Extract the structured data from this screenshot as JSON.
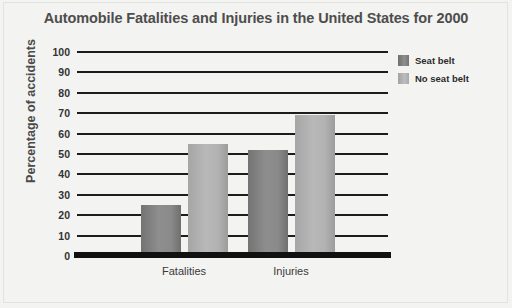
{
  "chart_data": {
    "type": "bar",
    "title": "Automobile Fatalities and Injuries in the United States for 2000",
    "xlabel": "",
    "ylabel": "Percentage of accidents",
    "categories": [
      "Fatalities",
      "Injuries"
    ],
    "series": [
      {
        "name": "Seat belt",
        "values": [
          25,
          52
        ],
        "color": "#8a8a8a"
      },
      {
        "name": "No seat belt",
        "values": [
          55,
          69
        ],
        "color": "#b2b2b2"
      }
    ],
    "ylim": [
      0,
      100
    ],
    "yticks": [
      0,
      10,
      20,
      30,
      40,
      50,
      60,
      70,
      80,
      90,
      100
    ],
    "ytick_labels": [
      "0",
      "10",
      "20",
      "30",
      "40",
      "50",
      "60",
      "70",
      "80",
      "90",
      "100"
    ],
    "grid": true,
    "legend_position": "top-right",
    "background_color": "#f3f3f1"
  }
}
